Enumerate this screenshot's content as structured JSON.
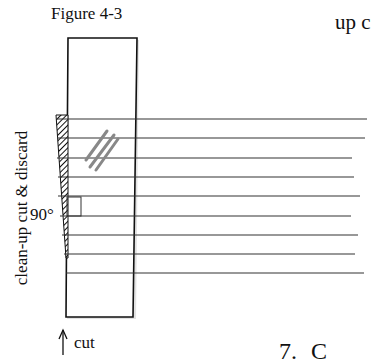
{
  "figure": {
    "title": "Figure 4-3",
    "side_label": "clean-up cut & discard",
    "angle_label": "90°",
    "cut_label": "cut"
  },
  "surrounding_text": {
    "top_right_fragment": "up c",
    "bottom_right_fragment": "7. C"
  },
  "shapes": {
    "rectangle": {
      "left": 68,
      "top": 38,
      "right": 136,
      "bottom": 317
    },
    "lines": [
      {
        "y": 119,
        "x1": 57,
        "x2": 367
      },
      {
        "y": 138,
        "x1": 57,
        "x2": 365
      },
      {
        "y": 158,
        "x1": 57,
        "x2": 352
      },
      {
        "y": 177,
        "x1": 58,
        "x2": 354
      },
      {
        "y": 196,
        "x1": 58,
        "x2": 360
      },
      {
        "y": 216,
        "x1": 60,
        "x2": 351
      },
      {
        "y": 235,
        "x1": 62,
        "x2": 358
      },
      {
        "y": 254,
        "x1": 64,
        "x2": 355
      },
      {
        "y": 273,
        "x1": 66,
        "x2": 364
      }
    ],
    "colors": {
      "ink": "#111111",
      "grey_marks": "#888888"
    }
  }
}
